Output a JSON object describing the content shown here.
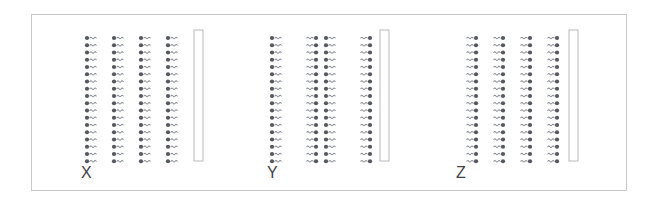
{
  "figure": {
    "background_color": "#ffffff",
    "frame": {
      "x": 31,
      "y": 14,
      "width": 596,
      "height": 177,
      "border_color": "#c9cacc"
    },
    "colors": {
      "head": "#55585e",
      "tail": "#8b8e94",
      "barrier_fill": "#ffffff",
      "barrier_stroke": "#b9babd",
      "label": "#3f4246"
    },
    "molecule": {
      "head_shape": "circle",
      "head_radius": 2.1,
      "tail_shape": "wave",
      "tail_length": 17,
      "tail_wavelength": 4.2,
      "tail_amplitude": 1.5,
      "unit_pitch_x": 27,
      "unit_pitch_y": 7.25
    },
    "panels": [
      {
        "id": "panel-x",
        "label": "X",
        "left": 80,
        "label_y": 164,
        "rows": 18,
        "columns": 4,
        "grid_x": 86,
        "grid_y": 37,
        "orientations": [
          "right",
          "right",
          "right",
          "right"
        ],
        "barrier": {
          "x": 193,
          "y": 29,
          "width": 9,
          "height": 131
        }
      },
      {
        "id": "panel-y",
        "label": "Y",
        "left": 266,
        "label_y": 164,
        "rows": 18,
        "columns": 4,
        "grid_x": 271,
        "grid_y": 37,
        "orientations": [
          "right",
          "left",
          "right",
          "left"
        ],
        "barrier": {
          "x": 379,
          "y": 29,
          "width": 9,
          "height": 131
        }
      },
      {
        "id": "panel-z",
        "label": "Z",
        "left": 455,
        "label_y": 164,
        "rows": 18,
        "columns": 4,
        "grid_x": 458,
        "grid_y": 37,
        "orientations": [
          "left",
          "left",
          "left",
          "left"
        ],
        "barrier": {
          "x": 568,
          "y": 29,
          "width": 9,
          "height": 131
        }
      }
    ]
  }
}
